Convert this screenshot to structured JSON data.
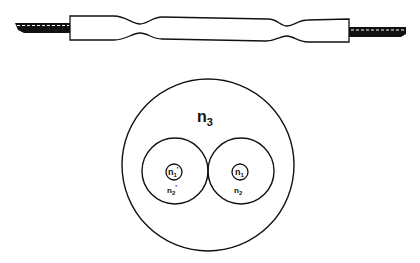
{
  "diagram": {
    "type": "fiber-coupler-schematic",
    "top_view": {
      "description": "Fused biconical taper coupler side view with two waists and fiber leads on both ends",
      "colors": {
        "stroke": "#111111",
        "lead_fill": "#111111",
        "lead_dash": "#ffffff",
        "body_fill": "#ffffff"
      }
    },
    "cross_section": {
      "outer_region_label": "n",
      "outer_region_sub": "3",
      "left_fiber": {
        "core_label": "n",
        "core_sub": "1",
        "core_prime": "'",
        "cladding_label": "n",
        "cladding_sub": "2",
        "cladding_prime": "'"
      },
      "right_fiber": {
        "core_label": "n",
        "core_sub": "1",
        "cladding_label": "n",
        "cladding_sub": "2"
      }
    }
  }
}
